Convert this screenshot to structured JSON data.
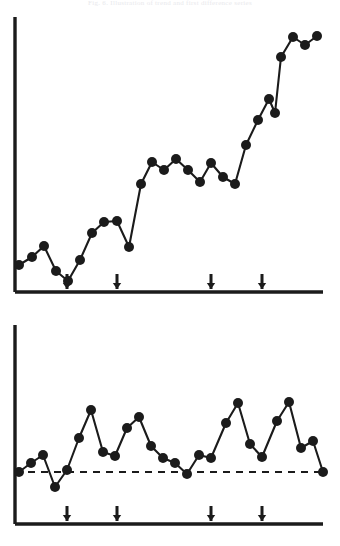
{
  "figure": {
    "caption": "Fig. 6.  Illustration of trend and first difference series",
    "background_color": "#ffffff",
    "ink_color": "#1b1b1b"
  },
  "panels": [
    {
      "name": "top-panel",
      "role": "level-series",
      "axis": {
        "origin_x": 15,
        "origin_y": 292,
        "y_top": 17,
        "x_right": 323,
        "show_ticks": false,
        "x_label": "",
        "y_label": "",
        "tick_labels": []
      },
      "baseline": null,
      "event_markers": [
        {
          "label": "arrow-1",
          "x": 67
        },
        {
          "label": "arrow-2",
          "x": 117
        },
        {
          "label": "arrow-3",
          "x": 211
        },
        {
          "label": "arrow-4",
          "x": 262
        }
      ],
      "marker_radius": 5.0
    },
    {
      "name": "bottom-panel",
      "role": "first-difference-series",
      "axis": {
        "origin_x": 15,
        "origin_y": 524,
        "y_top": 325,
        "x_right": 323,
        "show_ticks": false,
        "x_label": "",
        "y_label": "",
        "tick_labels": []
      },
      "baseline": {
        "label": "zero-line",
        "y": 472,
        "x_start": 15,
        "x_end": 323,
        "style": "dashed"
      },
      "event_markers": [
        {
          "label": "arrow-1",
          "x": 67
        },
        {
          "label": "arrow-2",
          "x": 117
        },
        {
          "label": "arrow-3",
          "x": 211
        },
        {
          "label": "arrow-4",
          "x": 262
        }
      ],
      "marker_radius": 5.0
    }
  ],
  "chart_data": [
    {
      "type": "line",
      "title": "",
      "subtitle": "",
      "xlabel": "",
      "ylabel": "",
      "panel": "top-panel",
      "grid": false,
      "legend": "none",
      "series_name": "level",
      "marker": "filled-circle",
      "xlim": [
        15,
        323
      ],
      "ylim": [
        17,
        292
      ],
      "annotations": [
        {
          "type": "arrow-up",
          "x": 67
        },
        {
          "type": "arrow-up",
          "x": 117
        },
        {
          "type": "arrow-up",
          "x": 211
        },
        {
          "type": "arrow-up",
          "x": 262
        }
      ],
      "points": [
        {
          "x": 19,
          "y": 265
        },
        {
          "x": 32,
          "y": 257
        },
        {
          "x": 44,
          "y": 246
        },
        {
          "x": 56,
          "y": 271
        },
        {
          "x": 68,
          "y": 281
        },
        {
          "x": 80,
          "y": 260
        },
        {
          "x": 92,
          "y": 233
        },
        {
          "x": 104,
          "y": 222
        },
        {
          "x": 117,
          "y": 221
        },
        {
          "x": 129,
          "y": 247
        },
        {
          "x": 141,
          "y": 184
        },
        {
          "x": 152,
          "y": 162
        },
        {
          "x": 164,
          "y": 170
        },
        {
          "x": 176,
          "y": 159
        },
        {
          "x": 188,
          "y": 170
        },
        {
          "x": 200,
          "y": 182
        },
        {
          "x": 211,
          "y": 163
        },
        {
          "x": 223,
          "y": 177
        },
        {
          "x": 235,
          "y": 184
        },
        {
          "x": 246,
          "y": 145
        },
        {
          "x": 258,
          "y": 120
        },
        {
          "x": 269,
          "y": 99
        },
        {
          "x": 275,
          "y": 113
        },
        {
          "x": 281,
          "y": 57
        },
        {
          "x": 293,
          "y": 37
        },
        {
          "x": 305,
          "y": 45
        },
        {
          "x": 317,
          "y": 36
        }
      ]
    },
    {
      "type": "line",
      "title": "",
      "subtitle": "",
      "xlabel": "",
      "ylabel": "",
      "panel": "bottom-panel",
      "grid": false,
      "legend": "none",
      "series_name": "first-difference",
      "marker": "filled-circle",
      "xlim": [
        15,
        323
      ],
      "ylim": [
        325,
        524
      ],
      "zero_line_y": 472,
      "annotations": [
        {
          "type": "arrow-up",
          "x": 67
        },
        {
          "type": "arrow-up",
          "x": 117
        },
        {
          "type": "arrow-up",
          "x": 211
        },
        {
          "type": "arrow-up",
          "x": 262
        }
      ],
      "points": [
        {
          "x": 19,
          "y": 472
        },
        {
          "x": 31,
          "y": 463
        },
        {
          "x": 43,
          "y": 455
        },
        {
          "x": 55,
          "y": 487
        },
        {
          "x": 67,
          "y": 470
        },
        {
          "x": 79,
          "y": 438
        },
        {
          "x": 91,
          "y": 410
        },
        {
          "x": 103,
          "y": 452
        },
        {
          "x": 115,
          "y": 456
        },
        {
          "x": 127,
          "y": 428
        },
        {
          "x": 139,
          "y": 417
        },
        {
          "x": 151,
          "y": 446
        },
        {
          "x": 163,
          "y": 458
        },
        {
          "x": 175,
          "y": 463
        },
        {
          "x": 187,
          "y": 474
        },
        {
          "x": 199,
          "y": 455
        },
        {
          "x": 211,
          "y": 458
        },
        {
          "x": 226,
          "y": 423
        },
        {
          "x": 238,
          "y": 403
        },
        {
          "x": 250,
          "y": 444
        },
        {
          "x": 262,
          "y": 457
        },
        {
          "x": 277,
          "y": 421
        },
        {
          "x": 289,
          "y": 402
        },
        {
          "x": 301,
          "y": 448
        },
        {
          "x": 313,
          "y": 441
        },
        {
          "x": 323,
          "y": 472
        }
      ]
    }
  ]
}
